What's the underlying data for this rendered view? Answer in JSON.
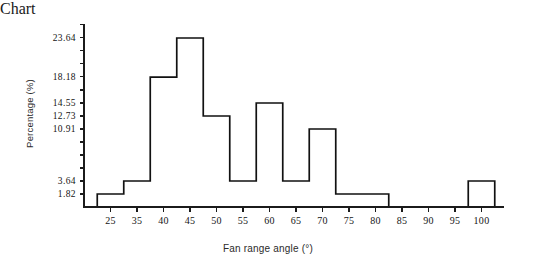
{
  "chart_data": {
    "type": "bar",
    "title": "",
    "xlabel": "Fan range angle (°)",
    "ylabel": "Percentage (%)",
    "categories": [
      "25",
      "35",
      "40",
      "45",
      "50",
      "55",
      "60",
      "65",
      "70",
      "75",
      "80",
      "85",
      "90",
      "95",
      "100"
    ],
    "values": [
      1.82,
      3.64,
      18.18,
      23.64,
      12.73,
      3.64,
      14.55,
      3.64,
      10.91,
      1.82,
      1.82,
      0,
      0,
      0,
      3.64
    ],
    "ytick_labels": [
      "1.82",
      "3.64",
      "10.91",
      "12.73",
      "14.55",
      "18.18",
      "23.64"
    ],
    "ytick_values": [
      1.82,
      3.64,
      10.91,
      12.73,
      14.55,
      18.18,
      23.64
    ],
    "xtick_labels": [
      "25",
      "35",
      "40",
      "45",
      "50",
      "55",
      "60",
      "65",
      "70",
      "75",
      "80",
      "85",
      "90",
      "95",
      "100"
    ],
    "ylim": [
      0,
      25.6
    ],
    "xlim": [
      0,
      16
    ],
    "grid": false,
    "legend": null,
    "legend_position": "none",
    "bar_style": "outline-only",
    "axis_color": "#111111"
  },
  "axes": {
    "y_title": "Percentage (%)",
    "x_title": "Fan range angle (°)"
  }
}
